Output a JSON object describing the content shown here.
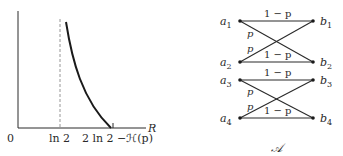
{
  "graph": {
    "origin_label": "0",
    "tick1_label": "ln 2",
    "tick2_label": "2 ln 2 −ℋ(p)",
    "x_axis_label": "R"
  },
  "channel": {
    "inputs": [
      "a",
      "a",
      "a",
      "a"
    ],
    "input_subs": [
      "1",
      "2",
      "3",
      "4"
    ],
    "outputs": [
      "b",
      "b",
      "b",
      "b"
    ],
    "output_subs": [
      "1",
      "2",
      "3",
      "4"
    ],
    "straight_label": "1 − p",
    "cross_label": "p",
    "caption": "𝒜"
  },
  "colors": {
    "ink": "#2a2a2a",
    "dashed": "#8a8a8a"
  }
}
